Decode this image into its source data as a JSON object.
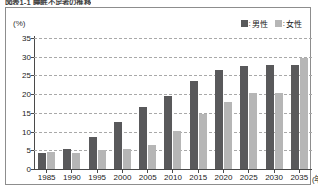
{
  "figure": {
    "caption": "図表1-1  睡眠不足者の推移",
    "unit_label": "(%)",
    "x_unit_label": "(年)"
  },
  "legend": {
    "position": "top-right",
    "entries": [
      {
        "key": "male",
        "swatch_icon": "square-swatch-icon",
        "separator": ":",
        "label": "男性",
        "color": "#59595b"
      },
      {
        "key": "female",
        "swatch_icon": "square-swatch-icon",
        "separator": ":",
        "label": "女性",
        "color": "#b6b6b6"
      }
    ]
  },
  "chart_data": {
    "type": "bar",
    "title": "図表1-1  睡眠不足者の推移",
    "xlabel": "(年)",
    "ylabel": "(%)",
    "ylim": [
      0,
      35
    ],
    "ytick_step": 5,
    "yticks": [
      35,
      30,
      25,
      20,
      15,
      10,
      5,
      0
    ],
    "grid": true,
    "grid_style": "dashed-horizontal",
    "legend_position": "top-right",
    "categories": [
      "1985",
      "1990",
      "1995",
      "2000",
      "2005",
      "2010",
      "2015",
      "2020",
      "2025",
      "2030",
      "2035"
    ],
    "series": [
      {
        "name": "男性",
        "color": "#59595b",
        "values": [
          4.3,
          5.4,
          8.6,
          12.6,
          16.5,
          19.6,
          23.5,
          26.5,
          27.4,
          27.7,
          27.8
        ]
      },
      {
        "name": "女性",
        "color": "#b6b6b6",
        "values": [
          4.5,
          4.2,
          5.1,
          5.3,
          6.5,
          10.1,
          14.6,
          17.9,
          20.3,
          20.4,
          29.6
        ]
      }
    ]
  },
  "colors": {
    "male": "#59595b",
    "female": "#b6b6b6",
    "axis": "#4a4a4a",
    "grid": "#a9a9a9",
    "frame": "#8d8d8d",
    "background": "#ffffff"
  }
}
